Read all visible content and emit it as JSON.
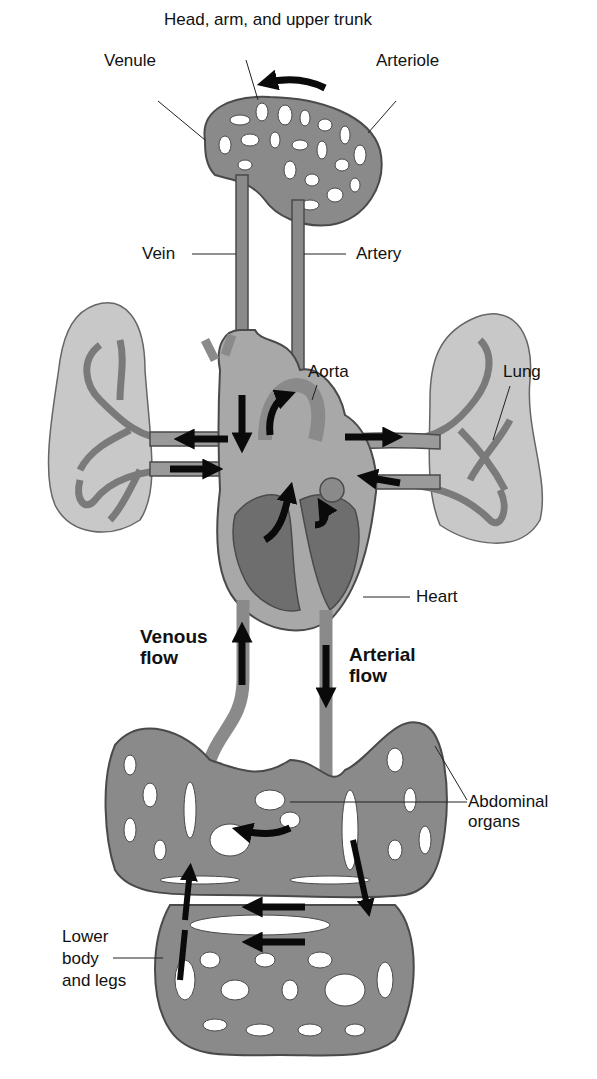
{
  "diagram": {
    "colors": {
      "vessel": "#8a8a8a",
      "vessel_edge": "#4a4a4a",
      "lung_fill": "#c8c8c8",
      "heart_chamber": "#6e6e6e",
      "arrow": "#0a0a0a",
      "background": "#ffffff"
    },
    "labels": {
      "head": "Head, arm, and upper trunk",
      "venule": "Venule",
      "arteriole": "Arteriole",
      "vein": "Vein",
      "artery": "Artery",
      "aorta": "Aorta",
      "lung": "Lung",
      "heart": "Heart",
      "venous_flow_1": "Venous",
      "venous_flow_2": "flow",
      "arterial_flow_1": "Arterial",
      "arterial_flow_2": "flow",
      "abdominal_1": "Abdominal",
      "abdominal_2": "organs",
      "lower_1": "Lower",
      "lower_2": "body",
      "lower_3": "and legs"
    },
    "flow_arrows": [
      "head-capillary-arrow-left",
      "vena-cava-down",
      "pulmonary-artery-left",
      "pulmonary-vein-right-into-heart",
      "pulmonary-artery-right",
      "pulmonary-vein-left-into-heart",
      "aorta-up",
      "venous-flow-up",
      "arterial-flow-down",
      "abdominal-arrow-left",
      "lower-body-arrow-left-1",
      "lower-body-arrow-left-2"
    ]
  }
}
